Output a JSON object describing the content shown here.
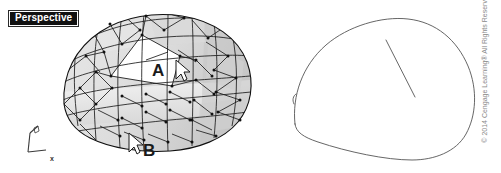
{
  "viewport": {
    "label": "Perspective",
    "label_bg": "#111111",
    "label_fg": "#ffffff"
  },
  "annotations": {
    "a": "A",
    "b": "B"
  },
  "axis_indicator": {
    "x_label": "x",
    "y_label": "y",
    "z_label": "z"
  },
  "footer": {
    "copyright": "© 2014 Cengage Learning® All Rights Reserved"
  },
  "colors": {
    "background": "#ffffff",
    "mesh_line": "#1c1c1c",
    "mesh_fill_light": "#efefef",
    "mesh_fill_mid": "#dcdcdc",
    "mesh_fill_dark": "#c9c9c9",
    "outline": "#5a5a5a",
    "cursor": "#ffffff",
    "cursor_stroke": "#1a1a1a"
  }
}
